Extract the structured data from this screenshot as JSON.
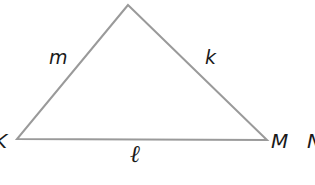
{
  "diagram": {
    "type": "triangle",
    "stroke_color": "#9a9a9a",
    "background": "#ffffff",
    "vertices": [
      {
        "id": "apex",
        "label": "",
        "x": 128,
        "y": 5
      },
      {
        "id": "K",
        "label": "K",
        "x": 17,
        "y": 139
      },
      {
        "id": "M",
        "label": "M",
        "x": 267,
        "y": 140
      }
    ],
    "sides": [
      {
        "id": "m",
        "label": "m",
        "between": [
          "K",
          "apex"
        ]
      },
      {
        "id": "k",
        "label": "k",
        "between": [
          "apex",
          "M"
        ]
      },
      {
        "id": "l",
        "label": "ℓ",
        "between": [
          "K",
          "M"
        ]
      }
    ],
    "extra_labels": [
      {
        "id": "cut-off",
        "label": "N",
        "note": "partially visible at right edge"
      }
    ]
  },
  "labels": {
    "vertex_K": "K",
    "vertex_M": "M",
    "side_m": "m",
    "side_k": "k",
    "side_l": "ℓ",
    "partial_right": "N"
  }
}
